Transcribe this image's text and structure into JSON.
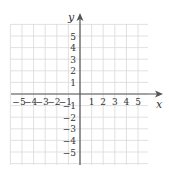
{
  "chart_data": {
    "type": "scatter",
    "title": "",
    "xlabel": "x",
    "ylabel": "y",
    "xlim": [
      -6,
      6
    ],
    "ylim": [
      -6,
      6
    ],
    "grid": true,
    "x_ticks": [
      -5,
      -4,
      -3,
      -2,
      -1,
      1,
      2,
      3,
      4,
      5
    ],
    "y_ticks": [
      5,
      4,
      3,
      2,
      1,
      -1,
      -2,
      -3,
      -4,
      -5
    ],
    "x_tick_labels": [
      "−5",
      "−4",
      "−3",
      "−2",
      "−1",
      "1",
      "2",
      "3",
      "4",
      "5"
    ],
    "y_tick_labels": [
      "5",
      "4",
      "3",
      "2",
      "1",
      "−1",
      "−2",
      "−3",
      "−4",
      "−5"
    ],
    "series": [],
    "legend": null
  },
  "colors": {
    "grid": "#d9d9d9",
    "axis": "#555555",
    "text": "#333333",
    "background": "#ffffff"
  }
}
